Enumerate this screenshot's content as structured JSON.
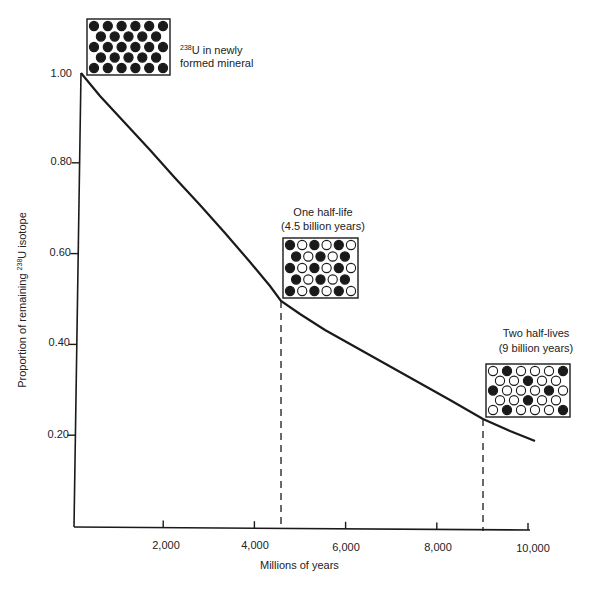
{
  "chart_data": {
    "type": "line",
    "title": "",
    "xlabel": "Millions of years",
    "ylabel_prefix": "Proportion of remaining ",
    "ylabel_sup": "238",
    "ylabel_suffix": "U isotope",
    "xlim": [
      0,
      10000
    ],
    "ylim": [
      0,
      1.0
    ],
    "x_ticks": [
      "2,000",
      "4,000",
      "6,000",
      "8,000",
      "10,000"
    ],
    "x_tick_values": [
      2000,
      4000,
      6000,
      8000,
      10000
    ],
    "y_ticks": [
      "1.00",
      "0.80",
      "0.60",
      "0.40",
      "0.20"
    ],
    "y_tick_values": [
      1.0,
      0.8,
      0.6,
      0.4,
      0.2
    ],
    "grid": false,
    "series": [
      {
        "name": "238U decay curve",
        "x": [
          0,
          1000,
          2000,
          3000,
          4000,
          4500,
          5000,
          6000,
          7000,
          8000,
          9000,
          10000
        ],
        "y": [
          1.0,
          0.857,
          0.735,
          0.63,
          0.54,
          0.5,
          0.463,
          0.397,
          0.34,
          0.292,
          0.25,
          0.214
        ]
      }
    ],
    "reference_lines": [
      {
        "x": 4500,
        "y": 0.5,
        "style": "dashed",
        "label": "One half-life"
      },
      {
        "x": 9000,
        "y": 0.25,
        "style": "dashed",
        "label": "Two half-lives"
      }
    ],
    "annotations": [
      {
        "id": "start",
        "sup": "238",
        "line1": "U in newly",
        "line2": "formed mineral",
        "dots": [
          [
            1,
            1,
            1,
            1,
            1,
            1
          ],
          [
            1,
            1,
            1,
            1,
            1
          ],
          [
            1,
            1,
            1,
            1,
            1,
            1
          ],
          [
            1,
            1,
            1,
            1,
            1
          ],
          [
            1,
            1,
            1,
            1,
            1,
            1
          ]
        ]
      },
      {
        "id": "one-half-life",
        "line1": "One half-life",
        "line2": "(4.5 billion years)",
        "dots": [
          [
            1,
            0,
            1,
            0,
            1,
            0
          ],
          [
            1,
            0,
            1,
            0,
            1
          ],
          [
            1,
            0,
            1,
            0,
            1,
            0
          ],
          [
            1,
            0,
            1,
            0,
            1
          ],
          [
            1,
            0,
            1,
            0,
            1,
            0
          ]
        ]
      },
      {
        "id": "two-half-lives",
        "line1": "Two half-lives",
        "line2": "(9 billion years)",
        "dots": [
          [
            0,
            1,
            0,
            0,
            0,
            1
          ],
          [
            0,
            0,
            1,
            0,
            0
          ],
          [
            1,
            0,
            0,
            0,
            1,
            0
          ],
          [
            0,
            0,
            1,
            0,
            0
          ],
          [
            0,
            1,
            0,
            0,
            0,
            1
          ]
        ]
      }
    ]
  },
  "colors": {
    "ink": "#1a1a1a",
    "paper": "#ffffff"
  }
}
